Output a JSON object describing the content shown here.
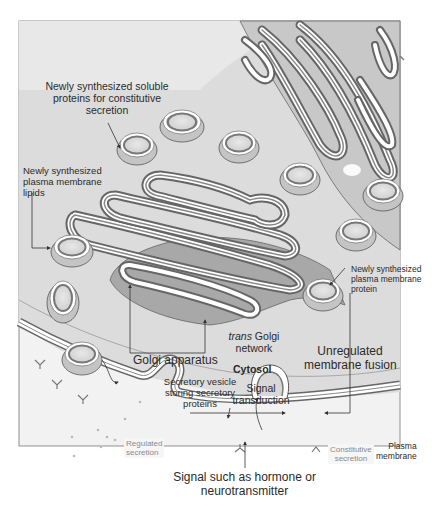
{
  "figure": {
    "colors": {
      "background": "#ffffff",
      "extracellular": "#f2f2f2",
      "cytosol": "#d9d9d9",
      "lumen": "#e4e4e4",
      "membrane_dark": "#7a7a7a",
      "membrane_light": "#ffffff",
      "outline": "#555555",
      "text": "#2a2a2a",
      "faint_text": "#8a8a8a"
    }
  },
  "labels": {
    "soluble_proteins": {
      "line1": "Newly synthesized soluble",
      "line2": "proteins for constitutive",
      "line3": "secretion"
    },
    "membrane_lipids": {
      "line1": "Newly synthesized",
      "line2": "plasma membrane",
      "line3": "lipids"
    },
    "membrane_protein": {
      "line1": "Newly synthesized",
      "line2": "plasma membrane",
      "line3": "protein"
    },
    "golgi_apparatus": "Golgi apparatus",
    "trans_golgi": {
      "prefix": "trans",
      "suffix": " Golgi",
      "line2": "network"
    },
    "cytosol": "Cytosol",
    "unregulated_fusion": {
      "line1": "Unregulated",
      "line2": "membrane fusion"
    },
    "secretory_vesicle": {
      "line1": "Secretory vesicle",
      "line2": "storing secretory",
      "line3": "proteins"
    },
    "signal_transduction": {
      "line1": "Signal",
      "line2": "transduction"
    },
    "regulated_secretion": {
      "line1": "Regulated",
      "line2": "secretion"
    },
    "constitutive_secretion": {
      "line1": "Constitutive",
      "line2": "secretion"
    },
    "plasma_membrane": {
      "line1": "Plasma",
      "line2": "membrane"
    },
    "signal_source": {
      "line1": "Signal such as hormone or",
      "line2": "neurotransmitter"
    }
  }
}
